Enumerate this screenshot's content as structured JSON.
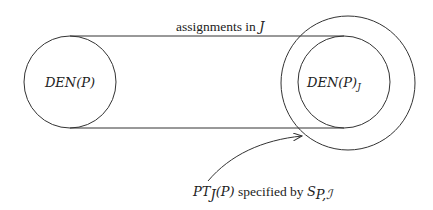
{
  "diagram": {
    "left_circle": {
      "label_main": "DEN(P)",
      "cx": 70,
      "cy": 82,
      "r": 46
    },
    "right_outer_circle": {
      "cx": 348,
      "cy": 83,
      "r": 67
    },
    "right_inner_circle": {
      "label_main": "DEN(P)",
      "label_sub": "J",
      "cx": 344,
      "cy": 82,
      "r": 46
    },
    "top_line_label": {
      "text_roman": "assignments in ",
      "text_italic": "J"
    },
    "arrow_label": {
      "pt": "PT",
      "pt_sub": "J",
      "pt_arg": "(P)",
      "middle": " specified by ",
      "s": "S",
      "s_sub": "P,ℐ"
    },
    "stroke_color": "#333333"
  }
}
